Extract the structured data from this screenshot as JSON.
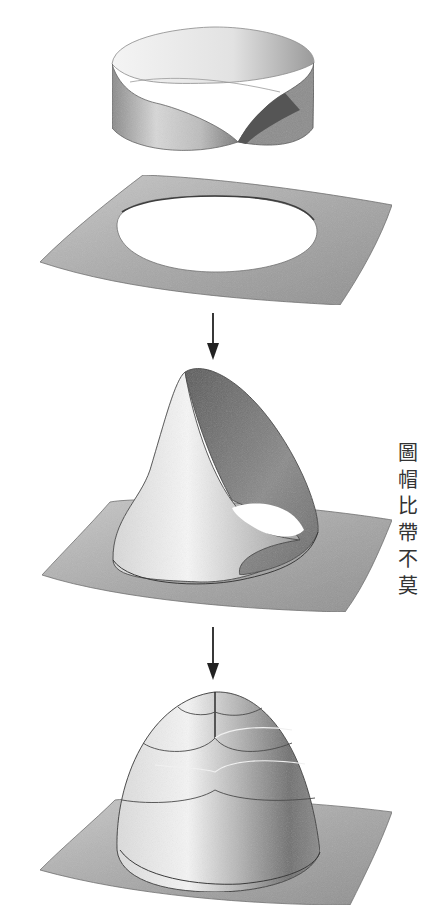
{
  "figure": {
    "stages": [
      {
        "name": "mobius-strip",
        "label": ""
      },
      {
        "name": "plane-with-hole",
        "label": ""
      },
      {
        "name": "cross-cap",
        "label": ""
      },
      {
        "name": "dome-surface",
        "label": ""
      }
    ],
    "arrows": [
      {
        "from": "plane-with-hole",
        "to": "cross-cap",
        "direction": "down"
      },
      {
        "from": "cross-cap",
        "to": "dome-surface",
        "direction": "down"
      }
    ],
    "colors": {
      "background": "#ffffff",
      "plane_gray": "#a8a8a8",
      "surface_dark": "#6e6e6e",
      "surface_light": "#f2f2f2",
      "outline": "#3a3a3a",
      "arrow": "#222222"
    }
  },
  "side_text": {
    "chars": [
      "圖",
      "帽",
      "比",
      "帶",
      "不",
      "莫"
    ]
  }
}
